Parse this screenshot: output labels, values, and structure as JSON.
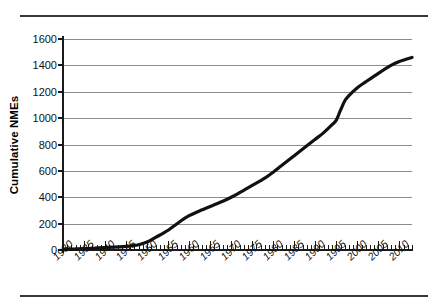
{
  "chart_data": {
    "type": "line",
    "title": "",
    "subtitle": "",
    "xlabel": "",
    "ylabel": "Cumulative NMEs",
    "xlim": [
      1930,
      2013
    ],
    "ylim": [
      0,
      1600
    ],
    "grid": true,
    "legend": null,
    "y_ticks": [
      0,
      200,
      400,
      600,
      800,
      1000,
      1200,
      1400,
      1600
    ],
    "x_ticks": [
      1930,
      1935,
      1940,
      1945,
      1950,
      1955,
      1960,
      1965,
      1970,
      1975,
      1980,
      1985,
      1990,
      1995,
      2000,
      2005,
      2010
    ],
    "x_minor_tick_step": 1,
    "series": [
      {
        "name": "Cumulative NMEs",
        "color": "#111111",
        "x": [
          1930,
          1935,
          1940,
          1945,
          1948,
          1950,
          1952,
          1955,
          1958,
          1960,
          1962,
          1965,
          1968,
          1970,
          1972,
          1975,
          1978,
          1980,
          1982,
          1985,
          1988,
          1990,
          1992,
          1994,
          1995,
          1996,
          1997,
          1998,
          2000,
          2002,
          2005,
          2008,
          2010,
          2013
        ],
        "y": [
          5,
          10,
          18,
          28,
          40,
          60,
          95,
          150,
          220,
          260,
          290,
          330,
          370,
          400,
          435,
          490,
          545,
          590,
          640,
          715,
          790,
          840,
          890,
          950,
          985,
          1060,
          1130,
          1170,
          1230,
          1275,
          1340,
          1400,
          1430,
          1460
        ]
      }
    ]
  },
  "axes": {
    "y_tick_labels": [
      "1600",
      "1400",
      "1200",
      "1000",
      "800",
      "600",
      "400",
      "200",
      "0"
    ],
    "x_tick_labels": [
      "1930",
      "1935",
      "1940",
      "1945",
      "1950",
      "1955",
      "1960",
      "1965",
      "1970",
      "1975",
      "1980",
      "1985",
      "1990",
      "1995",
      "2000",
      "2005",
      "2010"
    ],
    "y_axis_title": "Cumulative NMEs"
  },
  "colors": {
    "curve": "#111111",
    "gridline": "#8c8c8c",
    "axis": "#1a1a1a",
    "rule": "#3a3a3a",
    "background": "#ffffff"
  }
}
